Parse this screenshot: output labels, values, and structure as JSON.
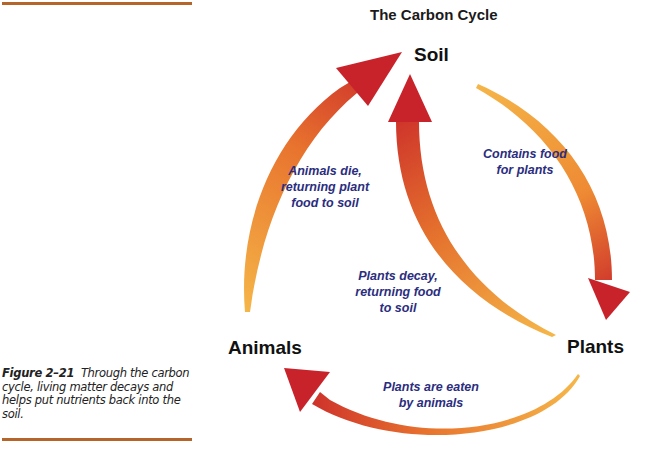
{
  "figure": {
    "number": "Figure 2–21",
    "caption": "Through the carbon cycle, living matter decays and helps put nutrients back into the soil."
  },
  "diagram": {
    "title": "The Carbon Cycle",
    "nodes": {
      "soil": "Soil",
      "plants": "Plants",
      "animals": "Animals"
    },
    "edges": [
      {
        "from": "Soil",
        "to": "Plants",
        "label_line1": "Contains food",
        "label_line2": "for plants"
      },
      {
        "from": "Plants",
        "to": "Soil",
        "label_line1": "Plants decay,",
        "label_line2": "returning food",
        "label_line3": "to soil"
      },
      {
        "from": "Plants",
        "to": "Animals",
        "label_line1": "Plants are eaten",
        "label_line2": "by animals"
      },
      {
        "from": "Animals",
        "to": "Soil",
        "label_line1": "Animals die,",
        "label_line2": "returning plant",
        "label_line3": "food to soil"
      }
    ],
    "colors": {
      "arrow_tail": "#f2a43a",
      "arrow_head": "#c8232a",
      "label_text": "#2b2d7e",
      "rule": "#b5652a"
    }
  }
}
